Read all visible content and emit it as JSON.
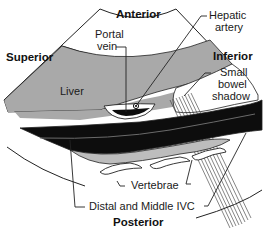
{
  "diagram": {
    "orientation_labels": {
      "top": "Anterior",
      "bottom": "Posterior",
      "left": "Superior",
      "right": "Inferior"
    },
    "structures": {
      "liver": "Liver",
      "portal_vein": [
        "Portal",
        "vein"
      ],
      "hepatic_artery": [
        "Hepatic",
        "artery"
      ],
      "small_bowel_shadow": [
        "Small",
        "bowel",
        "shadow"
      ],
      "vertebrae": "Vertebrae",
      "ivc": "Distal and Middle IVC"
    },
    "colors": {
      "liver": "#a9a9a9",
      "ivc": "#0d0d0d",
      "background": "#ffffff",
      "line": "#222222"
    }
  }
}
